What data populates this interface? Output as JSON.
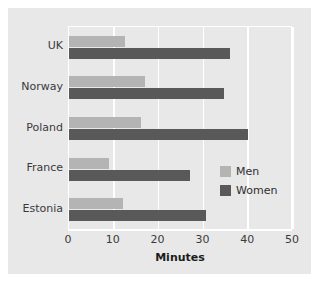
{
  "chart_data": {
    "type": "bar",
    "orientation": "horizontal",
    "title": "",
    "xlabel": "Minutes",
    "ylabel": "",
    "xlim": [
      0,
      50
    ],
    "xticks": [
      0,
      10,
      20,
      30,
      40,
      50
    ],
    "grid": true,
    "legend_position": "center-right",
    "categories": [
      "UK",
      "Norway",
      "Poland",
      "France",
      "Estonia"
    ],
    "series": [
      {
        "name": "Men",
        "color": "#b4b4b4",
        "values": [
          12.5,
          17,
          16,
          9,
          12
        ]
      },
      {
        "name": "Women",
        "color": "#595959",
        "values": [
          36,
          34.5,
          40,
          27,
          30.5
        ]
      }
    ]
  },
  "legend": {
    "items": [
      {
        "label": "Men"
      },
      {
        "label": "Women"
      }
    ]
  },
  "colors": {
    "men": "#b4b4b4",
    "women": "#595959",
    "background": "#e8e8e8",
    "gridline": "#ffffff"
  }
}
